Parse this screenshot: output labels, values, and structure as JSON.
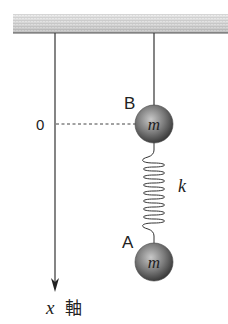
{
  "diagram": {
    "title": "",
    "ceiling": {
      "x": 13,
      "y": 14,
      "width": 215,
      "height": 19
    },
    "x_axis": {
      "label_var": "x",
      "label_text": "軸",
      "origin_label": "0",
      "x": 55,
      "y_start": 33,
      "y_end": 292
    },
    "masses": [
      {
        "id": "B",
        "label": "B",
        "mass_symbol": "m",
        "cx": 154,
        "cy": 124,
        "r": 19
      },
      {
        "id": "A",
        "label": "A",
        "mass_symbol": "m",
        "cx": 154,
        "cy": 262,
        "r": 19
      }
    ],
    "string": {
      "from": "ceiling",
      "to": "B"
    },
    "spring": {
      "label": "k",
      "from": "B",
      "to": "A",
      "coils": 12
    },
    "dashed_reference": {
      "from": "origin",
      "to": "B",
      "y": 124
    },
    "colors": {
      "line": "#333333",
      "ball_light": "#bdbdbd",
      "ball_dark": "#3a3a3a",
      "ceiling_light": "#e8e8e8",
      "ceiling_dark": "#9a9a9a"
    }
  }
}
